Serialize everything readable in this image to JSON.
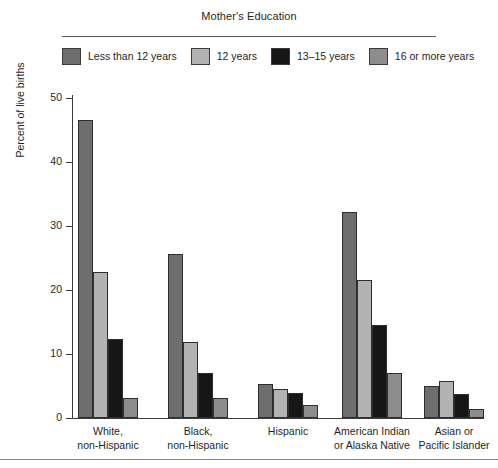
{
  "legend": {
    "title": "Mother's Education",
    "position": "top",
    "items": [
      {
        "label": "Less than 12 years",
        "color": "#6e6e6e"
      },
      {
        "label": "12 years",
        "color": "#b3b3b3"
      },
      {
        "label": "13–15 years",
        "color": "#161616"
      },
      {
        "label": "16 or more years",
        "color": "#8d8d8d"
      }
    ]
  },
  "chart_data": {
    "type": "bar",
    "title": "Mother's Education",
    "xlabel": "",
    "ylabel": "Percent of live births",
    "ylim": [
      0,
      50
    ],
    "yticks": [
      0,
      10,
      20,
      30,
      40,
      50
    ],
    "grid": false,
    "categories": [
      "White,\nnon-Hispanic",
      "Black,\nnon-Hispanic",
      "Hispanic",
      "American Indian\nor Alaska Native",
      "Asian or\nPacific Islander"
    ],
    "series": [
      {
        "name": "Less than 12 years",
        "color": "#6e6e6e",
        "values": [
          46.6,
          25.7,
          5.3,
          32.2,
          5.0
        ]
      },
      {
        "name": "12 years",
        "color": "#b3b3b3",
        "values": [
          22.8,
          11.9,
          4.6,
          21.5,
          5.8
        ]
      },
      {
        "name": "13–15 years",
        "color": "#161616",
        "values": [
          12.4,
          7.1,
          3.9,
          14.6,
          3.8
        ]
      },
      {
        "name": "16 or more years",
        "color": "#8d8d8d",
        "values": [
          3.1,
          3.2,
          2.0,
          7.0,
          1.4
        ]
      }
    ]
  }
}
